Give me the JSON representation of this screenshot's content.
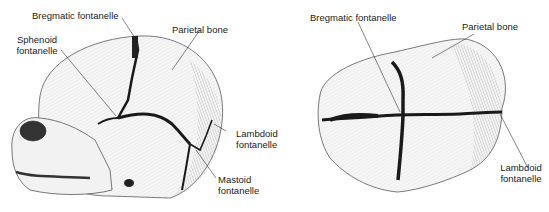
{
  "figures": [
    {
      "view": "lateral",
      "labels": {
        "bregmatic": "Bregmatic fontanelle",
        "parietal": "Parietal bone",
        "sphenoid_1": "Sphenoid",
        "sphenoid_2": "fontanelle",
        "lambdoid_1": "Lambdoid",
        "lambdoid_2": "fontanelle",
        "mastoid_1": "Mastoid",
        "mastoid_2": "fontanelle"
      }
    },
    {
      "view": "superior",
      "labels": {
        "bregmatic": "Bregmatic fontanelle",
        "parietal": "Parietal bone",
        "lambdoid_1": "Lambdoid",
        "lambdoid_2": "fontanelle"
      }
    }
  ],
  "colors": {
    "ink": "#222222",
    "suture": "#1a1a1a",
    "bone": "#f4f4f4"
  }
}
